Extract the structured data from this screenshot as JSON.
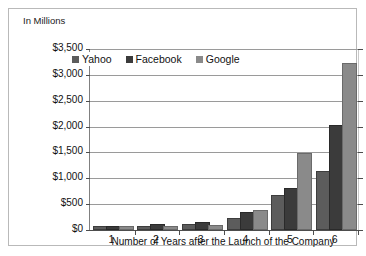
{
  "chart_data": {
    "type": "bar",
    "title": "",
    "ylabel": "In Millions",
    "xlabel": "Number of Years after the Launch of the Company",
    "categories": [
      "1",
      "2",
      "3",
      "4",
      "5",
      "6"
    ],
    "ylim": [
      0,
      3500
    ],
    "ytick_labels": [
      "$0",
      "$500",
      "$1,000",
      "$1,500",
      "$2,000",
      "$2,500",
      "$3,000",
      "$3,500"
    ],
    "ytick_values": [
      0,
      500,
      1000,
      1500,
      2000,
      2500,
      3000,
      3500
    ],
    "grid": true,
    "legend_position": "top-left-inside",
    "series": [
      {
        "name": "Yahoo",
        "color": "#5c5c5c",
        "values": [
          20,
          30,
          70,
          200,
          640,
          1100
        ]
      },
      {
        "name": "Facebook",
        "color": "#3b3b3b",
        "values": [
          10,
          70,
          120,
          310,
          780,
          2000
        ]
      },
      {
        "name": "Google",
        "color": "#8a8a8a",
        "values": [
          5,
          15,
          60,
          340,
          1450,
          3200
        ]
      }
    ]
  },
  "axis": {
    "y_title": "In Millions",
    "x_title": "Number of Years after the Launch of the Company"
  },
  "legend": {
    "items": [
      {
        "label": "Yahoo"
      },
      {
        "label": "Facebook"
      },
      {
        "label": "Google"
      }
    ]
  }
}
